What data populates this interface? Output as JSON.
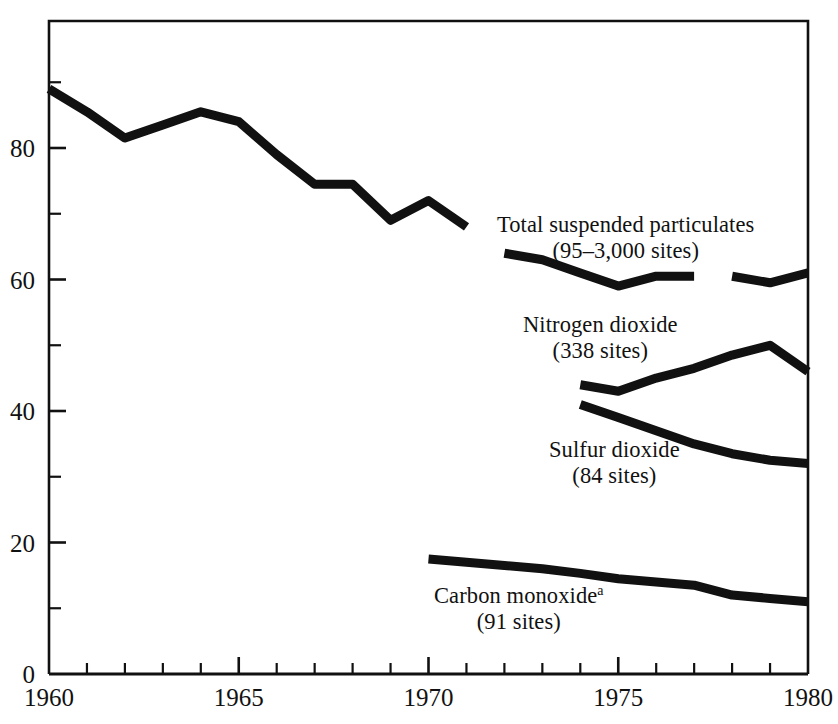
{
  "chart_data": {
    "type": "line",
    "title": "",
    "subtitle": "",
    "xlabel": "",
    "ylabel": "",
    "xlim": [
      1960,
      1980
    ],
    "ylim": [
      0,
      95
    ],
    "grid": false,
    "legend_position": "inline-annotations",
    "x_ticks_major": [
      "1960",
      "1965",
      "1970",
      "1975",
      "1980"
    ],
    "x_ticks_major_values": [
      1960,
      1965,
      1970,
      1975,
      1980
    ],
    "x_ticks_minor_values": [
      1961,
      1962,
      1963,
      1964,
      1966,
      1967,
      1968,
      1969,
      1971,
      1972,
      1973,
      1974,
      1976,
      1977,
      1978,
      1979
    ],
    "y_ticks_major": [
      "0",
      "20",
      "40",
      "60",
      "80"
    ],
    "y_ticks_major_values": [
      0,
      20,
      40,
      60,
      80
    ],
    "y_ticks_minor_values": [
      10,
      30,
      50,
      70,
      90
    ],
    "series": [
      {
        "name": "Total suspended particulates",
        "sites": "95-3,000 sites",
        "label_line1": "Total suspended particulates",
        "label_line2": "(95–3,000 sites)",
        "color": "#111111",
        "segments": [
          {
            "x": [
              1960,
              1961,
              1962,
              1963,
              1964,
              1965,
              1966,
              1967,
              1968,
              1969,
              1970,
              1971
            ],
            "values": [
              89.0,
              85.5,
              81.5,
              83.5,
              85.5,
              84.0,
              79.0,
              74.5,
              74.5,
              69.0,
              72.0,
              68.0
            ]
          },
          {
            "x": [
              1972,
              1973,
              1974,
              1975,
              1976,
              1977
            ],
            "values": [
              64.0,
              63.0,
              61.0,
              59.0,
              60.5,
              60.5
            ]
          },
          {
            "x": [
              1978,
              1979,
              1980
            ],
            "values": [
              60.5,
              59.5,
              61.0
            ]
          }
        ]
      },
      {
        "name": "Nitrogen dioxide",
        "sites": "338 sites",
        "label_line1": "Nitrogen dioxide",
        "label_line2": "(338 sites)",
        "color": "#111111",
        "segments": [
          {
            "x": [
              1974,
              1975,
              1976,
              1977,
              1978,
              1979,
              1980
            ],
            "values": [
              44.0,
              43.0,
              45.0,
              46.5,
              48.5,
              50.0,
              46.0
            ]
          }
        ]
      },
      {
        "name": "Sulfur dioxide",
        "sites": "84 sites",
        "label_line1": "Sulfur dioxide",
        "label_line2": "(84 sites)",
        "color": "#111111",
        "segments": [
          {
            "x": [
              1974,
              1975,
              1976,
              1977,
              1978,
              1979,
              1980
            ],
            "values": [
              41.0,
              39.0,
              37.0,
              35.0,
              33.5,
              32.5,
              32.0
            ]
          }
        ]
      },
      {
        "name": "Carbon monoxide",
        "sites": "91 sites",
        "label_line1": "Carbon monoxide",
        "label_line1_superscript": "a",
        "label_line2": "(91 sites)",
        "color": "#111111",
        "segments": [
          {
            "x": [
              1970,
              1971,
              1972,
              1973,
              1974,
              1975,
              1976,
              1977,
              1978,
              1979,
              1980
            ],
            "values": [
              17.5,
              17.0,
              16.5,
              16.0,
              15.3,
              14.5,
              14.0,
              13.5,
              12.0,
              11.5,
              11.0
            ]
          }
        ]
      }
    ]
  },
  "axes": {
    "y_labels": [
      {
        "text": "80",
        "value": 80
      },
      {
        "text": "60",
        "value": 60
      },
      {
        "text": "40",
        "value": 40
      },
      {
        "text": "20",
        "value": 20
      },
      {
        "text": "0",
        "value": 0
      }
    ],
    "x_labels": [
      {
        "text": "1960",
        "value": 1960
      },
      {
        "text": "1965",
        "value": 1965
      },
      {
        "text": "1970",
        "value": 1970
      },
      {
        "text": "1975",
        "value": 1975
      },
      {
        "text": "1980",
        "value": 1980
      }
    ]
  }
}
